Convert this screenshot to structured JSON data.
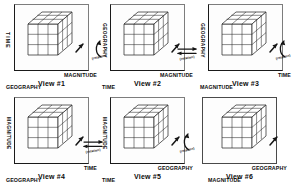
{
  "figure": {
    "dimensions": [
      "TIME",
      "GEOGRAPHY",
      "MAGNITUDE"
    ],
    "cube": {
      "rows": 3,
      "cols": 3,
      "layers": 3
    }
  },
  "views": [
    {
      "caption": "View #1",
      "vertical_axis": "TIME",
      "inner_axis": "GEOGRAPHY",
      "depth_axis": "MAGNITUDE"
    },
    {
      "caption": "View #2",
      "vertical_axis": "GEOGRAPHY",
      "inner_axis": "TIME",
      "depth_axis": "MAGNITUDE"
    },
    {
      "caption": "View #3",
      "vertical_axis": "GEOGRAPHY",
      "inner_axis": "MAGNITUDE",
      "depth_axis": "TIME"
    },
    {
      "caption": "View #4",
      "vertical_axis": "MAGNITUDE",
      "inner_axis": "GEOGRAPHY",
      "depth_axis": "TIME"
    },
    {
      "caption": "View #5",
      "vertical_axis": "MAGNITUDE",
      "inner_axis": "TIME",
      "depth_axis": "GEOGRAPHY"
    },
    {
      "caption": "View #6",
      "vertical_axis": "TIME",
      "inner_axis": "MAGNITUDE",
      "depth_axis": "GEOGRAPHY"
    }
  ],
  "connectors": [
    {
      "id": "rot-1-2",
      "label": "(rotation)",
      "kind": "curved"
    },
    {
      "id": "rot-2-3",
      "label": "(rotation)",
      "kind": "double-arrow"
    },
    {
      "id": "rot-3-right",
      "label": "(rotation)",
      "kind": "curved"
    },
    {
      "id": "rot-4-left",
      "label": "(rotation)",
      "kind": "double-arrow"
    },
    {
      "id": "rot-4-5",
      "label": "(rotation)",
      "kind": "double-arrow"
    },
    {
      "id": "rot-5-6",
      "label": "(rotation)",
      "kind": "curved"
    }
  ],
  "colors": {
    "ink": "#101010",
    "frame": "#1a1a1a",
    "cube_line": "#2b2b2b",
    "background": "#ffffff"
  }
}
